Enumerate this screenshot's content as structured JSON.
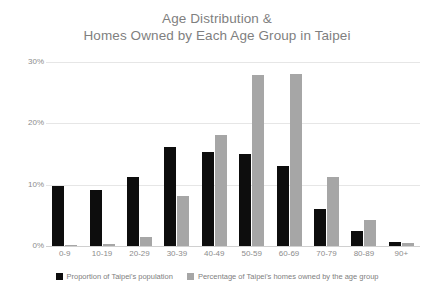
{
  "chart_data": {
    "type": "bar",
    "title": "Age Distribution & Homes Owned by Each Age Group in Taipei",
    "title_line1": "Age Distribution &",
    "title_line2": "Homes Owned by Each Age Group in Taipei",
    "xlabel": "",
    "ylabel": "",
    "ylim": [
      0,
      30
    ],
    "ytick_labels": [
      "0%",
      "10%",
      "20%",
      "30%"
    ],
    "ytick_values": [
      0,
      10,
      20,
      30
    ],
    "grid": true,
    "legend_position": "bottom",
    "categories": [
      "0-9",
      "10-19",
      "20-29",
      "30-39",
      "40-49",
      "50-59",
      "60-69",
      "70-79",
      "80-89",
      "90+"
    ],
    "series": [
      {
        "name": "Proportion of Taipei's population",
        "color": "#0d0d0d",
        "values": [
          9.8,
          9.2,
          11.3,
          16.1,
          15.3,
          15.0,
          13.0,
          6.0,
          2.5,
          0.7
        ]
      },
      {
        "name": "Percentage of Taipei's homes owned by the age group",
        "color": "#a6a6a6",
        "values": [
          0.1,
          0.3,
          1.5,
          8.2,
          18.1,
          27.9,
          28.0,
          11.3,
          4.2,
          0.5
        ]
      }
    ]
  },
  "legend": {
    "items": [
      {
        "label": "Proportion of Taipei's population",
        "swatch": "dark"
      },
      {
        "label": "Percentage of Taipei's homes owned by the age group",
        "swatch": "light"
      }
    ]
  }
}
